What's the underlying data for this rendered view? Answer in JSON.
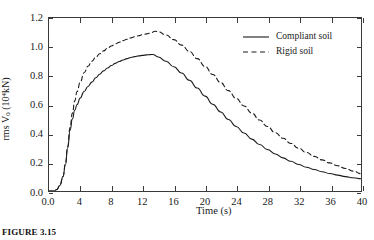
{
  "figure": {
    "caption": "FIGURE 3.15"
  },
  "chart_data": {
    "type": "line",
    "title": "",
    "xlabel": "Time (s)",
    "ylabel": "rms Ṽ0 (104 kN)",
    "ylabel_parts": {
      "prefix": "rms ",
      "symbol": "V",
      "subscript": "0",
      "unit_open": " (10",
      "unit_exp": "4",
      "unit_close": " kN)"
    },
    "xlim": [
      0,
      40
    ],
    "ylim": [
      0.0,
      1.2
    ],
    "grid": false,
    "legend_position": "top-right-inside",
    "xticks": [
      0,
      4,
      8,
      12,
      16,
      20,
      24,
      28,
      32,
      36,
      40
    ],
    "xtick_labels": [
      "0.0",
      "4",
      "8",
      "12",
      "16",
      "20",
      "24",
      "28",
      "32",
      "36",
      "40"
    ],
    "yticks": [
      0.0,
      0.2,
      0.4,
      0.6,
      0.8,
      1.0,
      1.2
    ],
    "ytick_labels": [
      "0.0",
      "0.2",
      "0.4",
      "0.6",
      "0.8",
      "1.0",
      "1.2"
    ],
    "series": [
      {
        "name": "Compliant soil",
        "style": "solid",
        "color": "#1a1a1a",
        "x": [
          0.0,
          0.6,
          1.0,
          1.4,
          1.8,
          2.1,
          2.4,
          2.7,
          3.0,
          3.3,
          3.6,
          4.0,
          4.5,
          5.0,
          5.5,
          6.0,
          6.5,
          7.0,
          7.5,
          8.0,
          8.5,
          9.0,
          9.5,
          10.0,
          10.5,
          11.0,
          11.5,
          12.0,
          12.5,
          13.0,
          13.3,
          14.0,
          15.0,
          16.0,
          17.0,
          18.0,
          19.0,
          20.0,
          21.0,
          22.0,
          23.0,
          24.0,
          25.0,
          26.0,
          27.0,
          28.0,
          29.0,
          30.0,
          31.0,
          32.0,
          33.0,
          34.0,
          35.0,
          36.0,
          37.0,
          38.0,
          39.0,
          40.0
        ],
        "y": [
          0.0,
          0.0,
          0.01,
          0.04,
          0.1,
          0.18,
          0.3,
          0.42,
          0.5,
          0.56,
          0.6,
          0.645,
          0.69,
          0.725,
          0.755,
          0.785,
          0.81,
          0.833,
          0.853,
          0.87,
          0.885,
          0.898,
          0.909,
          0.918,
          0.926,
          0.932,
          0.937,
          0.941,
          0.944,
          0.946,
          0.947,
          0.93,
          0.9,
          0.862,
          0.818,
          0.768,
          0.714,
          0.658,
          0.602,
          0.548,
          0.496,
          0.447,
          0.402,
          0.36,
          0.322,
          0.288,
          0.257,
          0.23,
          0.206,
          0.184,
          0.165,
          0.149,
          0.134,
          0.121,
          0.11,
          0.1,
          0.092,
          0.085
        ]
      },
      {
        "name": "Rigid soil",
        "style": "dashed",
        "color": "#1a1a1a",
        "x": [
          0.0,
          0.6,
          1.0,
          1.4,
          1.8,
          2.1,
          2.4,
          2.7,
          3.0,
          3.3,
          3.6,
          4.0,
          4.5,
          5.0,
          5.5,
          6.0,
          6.5,
          7.0,
          7.5,
          8.0,
          8.5,
          9.0,
          9.5,
          10.0,
          10.5,
          11.0,
          11.5,
          12.0,
          12.5,
          13.0,
          13.6,
          14.0,
          15.0,
          16.0,
          17.0,
          18.0,
          19.0,
          20.0,
          21.0,
          22.0,
          23.0,
          24.0,
          25.0,
          26.0,
          27.0,
          28.0,
          29.0,
          30.0,
          31.0,
          32.0,
          33.0,
          34.0,
          35.0,
          36.0,
          37.0,
          38.0,
          39.0,
          40.0
        ],
        "y": [
          0.0,
          0.0,
          0.01,
          0.04,
          0.1,
          0.19,
          0.31,
          0.44,
          0.54,
          0.625,
          0.69,
          0.755,
          0.82,
          0.865,
          0.9,
          0.928,
          0.952,
          0.972,
          0.99,
          1.006,
          1.02,
          1.032,
          1.043,
          1.053,
          1.062,
          1.07,
          1.077,
          1.084,
          1.09,
          1.096,
          1.108,
          1.105,
          1.082,
          1.05,
          1.012,
          0.968,
          0.918,
          0.864,
          0.808,
          0.752,
          0.696,
          0.642,
          0.59,
          0.54,
          0.492,
          0.447,
          0.405,
          0.366,
          0.33,
          0.297,
          0.267,
          0.24,
          0.216,
          0.195,
          0.175,
          0.156,
          0.138,
          0.12
        ]
      }
    ],
    "legend": [
      {
        "label": "Compliant soil",
        "style": "solid"
      },
      {
        "label": "Rigid soil",
        "style": "dashed"
      }
    ]
  }
}
